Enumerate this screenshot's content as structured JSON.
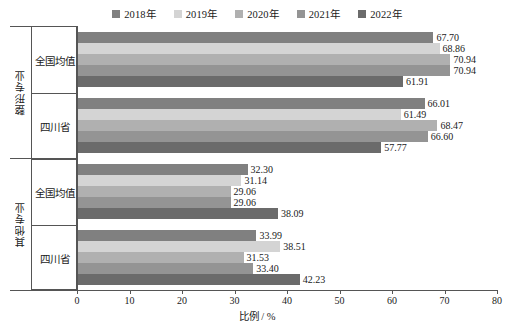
{
  "chart_data": {
    "type": "bar",
    "orientation": "horizontal",
    "title": "",
    "xlabel": "比例 / %",
    "ylabel": "",
    "xlim": [
      0,
      80
    ],
    "xticks": [
      0,
      10,
      20,
      30,
      40,
      50,
      60,
      70,
      80
    ],
    "grid": false,
    "legend_position": "top-center",
    "series": [
      {
        "name": "2018年",
        "color": "#808080",
        "values": [
          67.7,
          66.01,
          32.3,
          33.99
        ]
      },
      {
        "name": "2019年",
        "color": "#d4d4d4",
        "values": [
          68.86,
          61.49,
          31.14,
          38.51
        ]
      },
      {
        "name": "2020年",
        "color": "#b0b0b0",
        "values": [
          70.94,
          68.47,
          29.06,
          31.53
        ]
      },
      {
        "name": "2021年",
        "color": "#949494",
        "values": [
          70.94,
          66.6,
          29.06,
          33.4
        ]
      },
      {
        "name": "2022年",
        "color": "#6b6b6b",
        "values": [
          61.91,
          57.77,
          38.09,
          42.23
        ]
      }
    ],
    "categories": [
      "全国均值",
      "四川省",
      "全国均值",
      "四川省"
    ],
    "category_groups": [
      {
        "label": "整形专业",
        "categories": [
          "全国均值",
          "四川省"
        ]
      },
      {
        "label": "其他专业",
        "categories": [
          "全国均值",
          "四川省"
        ]
      }
    ],
    "data_labels": [
      [
        "67.70",
        "68.86",
        "70.94",
        "70.94",
        "61.91"
      ],
      [
        "66.01",
        "61.49",
        "68.47",
        "66.60",
        "57.77"
      ],
      [
        "32.30",
        "31.14",
        "29.06",
        "29.06",
        "38.09"
      ],
      [
        "33.99",
        "38.51",
        "31.53",
        "33.40",
        "42.23"
      ]
    ]
  },
  "axis": {
    "x_title": "比例 / %",
    "tick_labels": [
      "0",
      "10",
      "20",
      "30",
      "40",
      "50",
      "60",
      "70",
      "80"
    ]
  },
  "legend": {
    "items": [
      {
        "label": "2018年"
      },
      {
        "label": "2019年"
      },
      {
        "label": "2020年"
      },
      {
        "label": "2021年"
      },
      {
        "label": "2022年"
      }
    ]
  },
  "colors": {
    "s2018": "#808080",
    "s2019": "#d4d4d4",
    "s2020": "#b0b0b0",
    "s2021": "#949494",
    "s2022": "#6b6b6b",
    "axis": "#555555",
    "text": "#1a1a1a",
    "background": "#ffffff"
  }
}
